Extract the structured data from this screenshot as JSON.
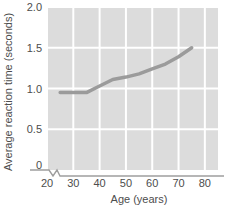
{
  "chart_data": {
    "type": "line",
    "title": "",
    "xlabel": "Age (years)",
    "ylabel": "Average reaction time (seconds)",
    "xlim": [
      20,
      85
    ],
    "ylim": [
      0,
      2.0
    ],
    "x_ticks": [
      20,
      30,
      40,
      50,
      60,
      70,
      80
    ],
    "x_tick_labels": [
      "20",
      "30",
      "40",
      "50",
      "60",
      "70",
      "80"
    ],
    "y_ticks": [
      0,
      0.5,
      1.0,
      1.5,
      2.0
    ],
    "y_tick_labels": [
      "0",
      "0.5",
      "1.0",
      "1.5",
      "2.0"
    ],
    "grid": true,
    "grid_color": "#ffffff",
    "plot_background": "#dcdcdc",
    "legend": null,
    "axis_break": {
      "axis": "x",
      "between": [
        0,
        20
      ],
      "symbol": "zigzag"
    },
    "series": [
      {
        "name": "Average reaction time",
        "color": "#9b9b9b",
        "line_width": 3.5,
        "x": [
          25,
          30,
          35,
          40,
          45,
          50,
          55,
          60,
          65,
          70,
          75
        ],
        "y": [
          0.95,
          0.95,
          0.95,
          1.03,
          1.11,
          1.14,
          1.18,
          1.24,
          1.3,
          1.39,
          1.5
        ]
      }
    ]
  }
}
